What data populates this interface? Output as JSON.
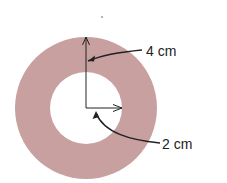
{
  "diagram": {
    "type": "annulus",
    "fill_color": "#c9a0a0",
    "line_color": "#222222",
    "outer_radius_label": "4 cm",
    "inner_radius_label": "2 cm"
  }
}
